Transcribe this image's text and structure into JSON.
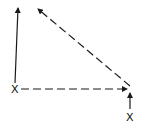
{
  "diagram": {
    "type": "vector-diagram",
    "stroke_color": "#1a1a1a",
    "background": "#ffffff",
    "points": [
      {
        "id": "left-x",
        "label": "X",
        "x": 15,
        "y": 89
      },
      {
        "id": "right-x",
        "label": "X",
        "x": 130,
        "y": 117
      }
    ],
    "arrows": [
      {
        "id": "solid-up-arrow",
        "style": "solid",
        "from": [
          15,
          83
        ],
        "to": [
          18,
          7
        ]
      },
      {
        "id": "dashed-horizontal-arrow",
        "style": "dashed",
        "from": [
          21,
          89
        ],
        "to": [
          127,
          89
        ]
      },
      {
        "id": "dashed-diagonal-arrow",
        "style": "dashed",
        "from": [
          130,
          86
        ],
        "to": [
          38,
          9
        ]
      },
      {
        "id": "short-up-arrow",
        "style": "solid",
        "from": [
          130,
          109
        ],
        "to": [
          130,
          93
        ]
      }
    ]
  }
}
